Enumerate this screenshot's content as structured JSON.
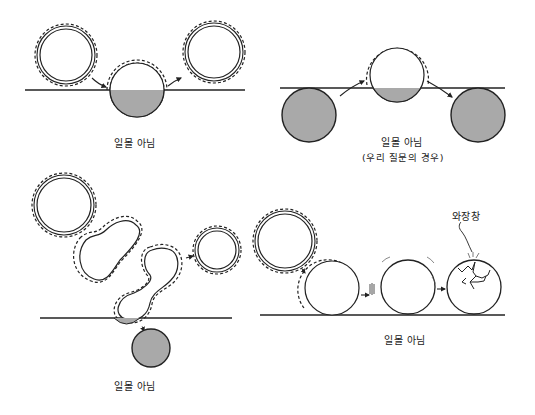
{
  "colors": {
    "background": "#ffffff",
    "line": "#222222",
    "planet_fill": "#a9a9a9",
    "sun_fill": "#ffffff"
  },
  "panels": [
    {
      "id": "panel-1",
      "description": "Sun rises over horizon, half-sunk sun (bottom half gray), then rises again",
      "label": "일몰 아님"
    },
    {
      "id": "panel-2",
      "description": "Gray sphere rises from below, passes above horizon as glowing sun, sinks again",
      "label": "일몰 아님",
      "sublabel": "(우리 질문의 경우)"
    },
    {
      "id": "panel-3",
      "description": "Sun stretches/squishes through peanut shapes, dips below horizon, gray ball drops",
      "label": "일몰 아님"
    },
    {
      "id": "panel-4",
      "description": "Sun rolls along horizon, loses glow, hits and cracks",
      "label": "일몰 아님",
      "annotation": "와장창"
    }
  ]
}
